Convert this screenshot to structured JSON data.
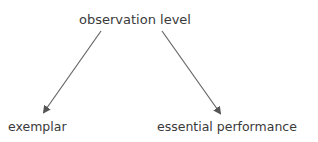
{
  "diagram": {
    "nodes": [
      {
        "id": "root",
        "label": "observation level"
      },
      {
        "id": "left",
        "label": "exemplar"
      },
      {
        "id": "right",
        "label": "essential performance"
      }
    ],
    "edges": [
      {
        "from": "root",
        "to": "left"
      },
      {
        "from": "root",
        "to": "right"
      }
    ],
    "colors": {
      "text": "#3a3a3a",
      "arrow": "#555555"
    }
  }
}
